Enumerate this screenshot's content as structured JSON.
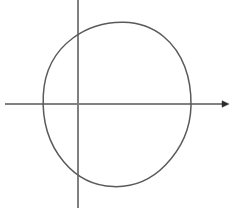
{
  "figure": {
    "background_color": "#ffffff",
    "width": 233,
    "height": 220,
    "axis_color": "#808080",
    "curve_color": "#5a5a5a",
    "axis_stroke_width": 1.4,
    "curve_stroke_width": 1.5
  },
  "chart_data": {
    "type": "scatter",
    "title": "",
    "subtitle": "",
    "xlabel": "",
    "ylabel": "",
    "grid": false,
    "legend": null,
    "annotations": [],
    "tick_labels": {
      "x": [],
      "y": []
    },
    "axes": {
      "x_axis": {
        "name": "horizontal-axis",
        "y": 104,
        "x_start": 5,
        "x_end": 228,
        "arrow_at_end": true,
        "arrow_size": 7
      },
      "y_axis": {
        "name": "vertical-axis",
        "x": 78,
        "y_start": 0,
        "y_end": 208,
        "arrow_at_end": false
      },
      "origin": {
        "x": 78,
        "y": 104
      }
    },
    "shapes": [
      {
        "name": "circle",
        "type": "ellipse",
        "center": {
          "x": 117,
          "y": 104
        },
        "rx": 74,
        "ry": 82,
        "filled": false,
        "stroke": "#5a5a5a",
        "hand_drawn": true,
        "path": "M 191 106 C 191.5 62 170 27.5 124 22.5 C 80 18 45 48 43.2 97 C 41.5 145 66 182 113 186.5 C 158 190.5 190 160 191 106 Z"
      }
    ],
    "intersections": [
      {
        "name": "circle-x-axis-left",
        "x": 43,
        "y": 104
      },
      {
        "name": "circle-x-axis-right",
        "x": 191,
        "y": 104
      },
      {
        "name": "circle-y-axis-top",
        "x": 78,
        "y": 28
      },
      {
        "name": "circle-y-axis-bottom",
        "x": 78,
        "y": 182
      }
    ]
  }
}
